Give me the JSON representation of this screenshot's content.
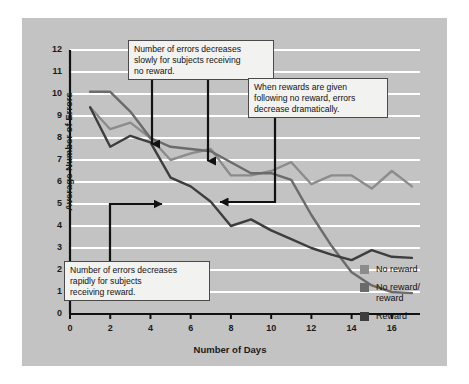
{
  "figure": {
    "background": "#ffffff",
    "panel_color": "#c3c3c3",
    "gridline_color": "#ffffff",
    "axis_color": "#111111"
  },
  "axis_titles": {
    "x": "Number of Days",
    "y": "Average Number of Errors"
  },
  "ticks": {
    "y": [
      "0",
      "1",
      "2",
      "3",
      "4",
      "5",
      "6",
      "7",
      "8",
      "9",
      "10",
      "11",
      "12"
    ],
    "x": [
      "0",
      "2",
      "4",
      "6",
      "8",
      "10",
      "12",
      "14",
      "16"
    ]
  },
  "legend": {
    "items": [
      {
        "label": "No reward",
        "color": "#8c8c8c"
      },
      {
        "label": "No reward/",
        "label2": "reward",
        "color": "#6b6b6b"
      },
      {
        "label": "Reward",
        "color": "#3d3d3d"
      }
    ]
  },
  "annotations": [
    {
      "id": "annotation-no-reward",
      "lines": [
        "Number of errors decreases",
        "slowly for subjects receiving",
        "no reward."
      ]
    },
    {
      "id": "annotation-no-reward-reward",
      "lines": [
        "When rewards are given",
        "following no reward, errors",
        "decrease dramatically."
      ]
    },
    {
      "id": "annotation-reward",
      "lines": [
        "Number of errors decreases",
        "rapidly for subjects",
        "receiving reward."
      ]
    }
  ],
  "chart_data": {
    "type": "line",
    "title": "",
    "xlabel": "Number of Days",
    "ylabel": "Average Number of Errors",
    "xlim": [
      0,
      17.4
    ],
    "ylim": [
      0,
      12
    ],
    "grid": true,
    "legend_position": "right",
    "x": [
      1,
      2,
      3,
      4,
      5,
      6,
      7,
      8,
      9,
      10,
      11,
      12,
      13,
      14,
      15,
      16,
      17
    ],
    "series": [
      {
        "name": "No reward",
        "color": "#8c8c8c",
        "values": [
          9.4,
          8.4,
          8.7,
          8.0,
          7.0,
          7.3,
          7.5,
          6.3,
          6.3,
          6.5,
          6.9,
          5.9,
          6.3,
          6.3,
          5.7,
          6.5,
          5.8
        ]
      },
      {
        "name": "No reward/reward",
        "color": "#6b6b6b",
        "values": [
          10.1,
          10.1,
          9.2,
          8.0,
          7.6,
          7.5,
          7.4,
          6.9,
          6.4,
          6.4,
          6.1,
          4.5,
          3.1,
          1.9,
          1.3,
          1.0,
          0.95
        ]
      },
      {
        "name": "Reward",
        "color": "#3d3d3d",
        "values": [
          9.4,
          7.6,
          8.1,
          7.8,
          6.2,
          5.8,
          5.1,
          4.0,
          4.3,
          3.8,
          3.4,
          3.0,
          2.7,
          2.45,
          2.9,
          2.6,
          2.55
        ]
      }
    ]
  }
}
